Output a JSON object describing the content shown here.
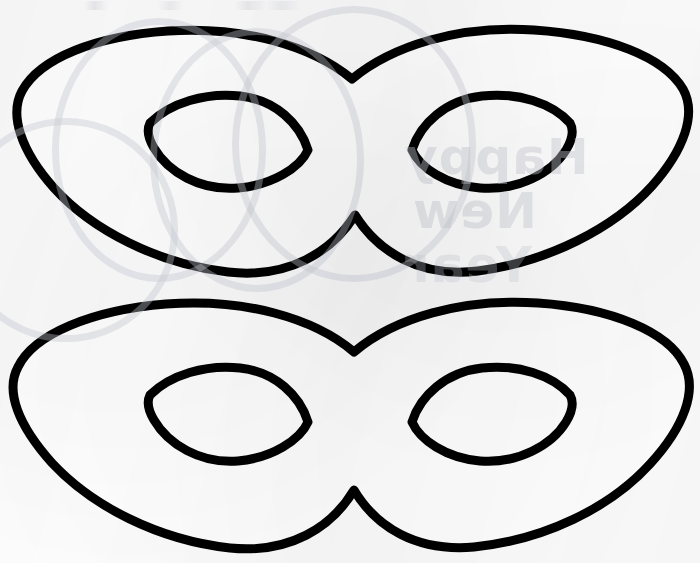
{
  "page": {
    "background_color": "#fcfcfd",
    "ink_color": "#000000",
    "width": 700,
    "height": 563,
    "caption": ""
  },
  "watermark": {
    "visible": true,
    "mirrored": true,
    "color": "#c9ccd6",
    "lines": [
      {
        "id": "happy",
        "text": "Happy"
      },
      {
        "id": "new",
        "text": "New"
      },
      {
        "id": "year",
        "text": "Year"
      }
    ]
  },
  "artwork": {
    "type": "line-drawing",
    "subject": "two identical masquerade eye masks, outline only",
    "stroke_color": "#000000",
    "fill_color": "#ffffff",
    "stroke_width": 9,
    "shapes": [
      {
        "id": "mask-top",
        "label": "Top eye mask outline",
        "outline_path": "M 22 91 C 40 58, 96 36, 168 31 C 244 26, 312 46, 352 79 C 392 46, 458 25, 534 30 C 608 35, 664 57, 683 89 C 697 114, 684 150, 652 186 C 614 228, 548 262, 478 271 C 420 278, 378 252, 355 215 C 332 252, 288 279, 228 272 C 158 264, 92 230, 54 188 C 21 151, 9 115, 22 91 Z",
        "eyes": [
          {
            "id": "mask-top-eye-left",
            "label": "Top mask left eye hole",
            "path": "M 150 123 C 170 103, 206 92, 240 96 C 276 100, 300 124, 308 150 C 300 168, 272 185, 238 188 C 200 191, 168 172, 154 148 C 148 138, 147 129, 150 123 Z"
          },
          {
            "id": "mask-top-eye-right",
            "label": "Top mask right eye hole",
            "path": "M 412 150 C 420 124, 446 100, 482 96 C 518 92, 552 103, 570 123 C 574 130, 572 140, 566 150 C 552 173, 518 191, 480 188 C 446 185, 420 168, 412 150 Z"
          }
        ]
      },
      {
        "id": "mask-bottom",
        "label": "Bottom eye mask outline",
        "outline_path": "M 18 367 C 34 334, 92 310, 166 304 C 244 298, 314 318, 354 352 C 394 318, 462 298, 538 303 C 612 308, 668 332, 684 364 C 698 390, 684 427, 650 464 C 610 508, 544 540, 474 547 C 416 552, 376 527, 354 490 C 332 527, 290 554, 230 548 C 158 540, 92 506, 52 463 C 18 425, 5 391, 18 367 Z",
        "eyes": [
          {
            "id": "mask-bottom-eye-left",
            "label": "Bottom mask left eye hole",
            "path": "M 150 395 C 170 375, 206 364, 240 368 C 276 372, 300 396, 308 422 C 300 440, 272 458, 238 461 C 200 464, 168 444, 154 420 C 148 410, 147 401, 150 395 Z"
          },
          {
            "id": "mask-bottom-eye-right",
            "label": "Bottom mask right eye hole",
            "path": "M 412 422 C 420 396, 446 372, 482 368 C 518 364, 552 375, 570 395 C 574 402, 572 412, 566 422 C 552 445, 518 464, 480 461 C 446 458, 420 440, 412 422 Z"
          }
        ]
      }
    ]
  }
}
